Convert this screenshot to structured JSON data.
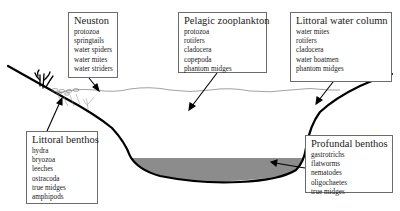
{
  "diagram": {
    "type": "lake-cross-section",
    "colors": {
      "shore_line": "#000000",
      "water_surface": "#8a8a8a",
      "sediment": "#8c8c8c",
      "box_border": "#6b6b6b",
      "text": "#1a1a1a"
    },
    "zones": [
      {
        "id": "neuston",
        "title": "Neuston",
        "items": [
          "protozoa",
          "springtails",
          "water spiders",
          "water mites",
          "water striders"
        ]
      },
      {
        "id": "pelagic",
        "title": "Pelagic zooplankton",
        "items": [
          "protozoa",
          "rotifers",
          "cladocera",
          "copepoda",
          "phantom midges"
        ]
      },
      {
        "id": "littoral_water",
        "title": "Littoral water column",
        "items": [
          "water mites",
          "rotifers",
          "cladocera",
          "water boatmen",
          "phantom midges"
        ]
      },
      {
        "id": "littoral_benthos",
        "title": "Littoral benthos",
        "items": [
          "hydra",
          "bryozoa",
          "leeches",
          "ostracoda",
          "true midges",
          "amphipods"
        ]
      },
      {
        "id": "profundal_benthos",
        "title": "Profundal benthos",
        "items": [
          "gastrotrichs",
          "flatworms",
          "nematodes",
          "oligochaetes",
          "true midges"
        ]
      }
    ]
  }
}
